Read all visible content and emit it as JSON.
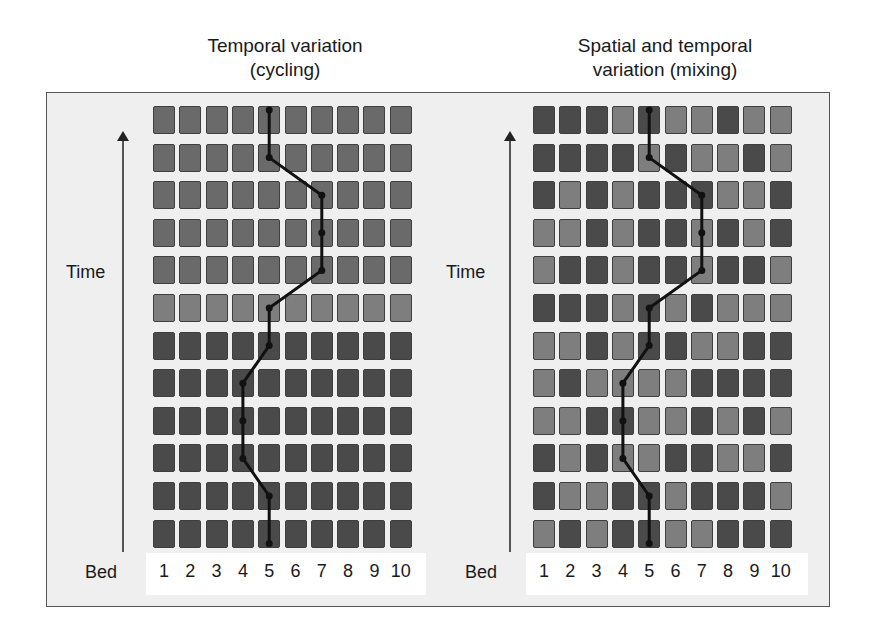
{
  "panels": [
    {
      "id": "cycling",
      "title_line1": "Temporal variation",
      "title_line2": "(cycling)",
      "y_axis_label": "Time",
      "x_axis_label": "Bed",
      "beds": [
        "1",
        "2",
        "3",
        "4",
        "5",
        "6",
        "7",
        "8",
        "9",
        "10"
      ],
      "rows_top_to_bottom": [
        "MMMMMMMMMM",
        "MMMMMMMMMM",
        "MMMMMMMMMM",
        "MMMMMMMMMM",
        "MMMMMMMMMM",
        "LLLLLLLLLL",
        "DDDDDDDDDD",
        "DDDDDDDDDD",
        "DDDDDDDDDD",
        "DDDDDDDDDD",
        "DDDDDDDDDD",
        "DDDDDDDDDD"
      ],
      "path_bed_by_row_top_to_bottom": [
        5,
        5,
        7,
        7,
        7,
        5,
        5,
        4,
        4,
        4,
        5,
        5
      ]
    },
    {
      "id": "mixing",
      "title_line1": "Spatial and temporal",
      "title_line2": "variation (mixing)",
      "y_axis_label": "Time",
      "x_axis_label": "Bed",
      "beds": [
        "1",
        "2",
        "3",
        "4",
        "5",
        "6",
        "7",
        "8",
        "9",
        "10"
      ],
      "rows_top_to_bottom": [
        "DDDLDLLDLL",
        "DDDDLDLLDL",
        "DLDLDDDLLD",
        "LLDLDDLDLD",
        "LDDLDDLDDL",
        "DDDLDLDLLL",
        "LLDLDDLLDD",
        "LDLLLLDDDD",
        "LLDDLLDLDL",
        "DLDLLDDLLD",
        "DLLDDLDDDL",
        "LDLDDLLDDD"
      ],
      "path_bed_by_row_top_to_bottom": [
        5,
        5,
        7,
        7,
        7,
        5,
        5,
        4,
        4,
        4,
        5,
        5
      ]
    }
  ],
  "colors": {
    "dark_cell": "#4a4a4a",
    "medium_cell": "#6a6a6a",
    "light_cell": "#7e7e7e",
    "path": "#111111",
    "frame_bg": "#efefef"
  }
}
